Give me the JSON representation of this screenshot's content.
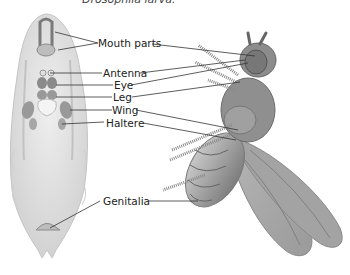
{
  "caption": "Drosophila larva.",
  "labels": {
    "mouth_parts": "Mouth parts",
    "antenna": "Antenna",
    "eye": "Eye",
    "leg": "Leg",
    "wing": "Wing",
    "haltere": "Haltere",
    "genitalia": "Genitalia"
  },
  "colors": {
    "larva_fill": "#e3e3e3",
    "disc_fill": "#9a9a9a",
    "fly_body": "#8c8c8c",
    "wing_fill": "#a8a8a8",
    "leader_line": "#333333"
  }
}
